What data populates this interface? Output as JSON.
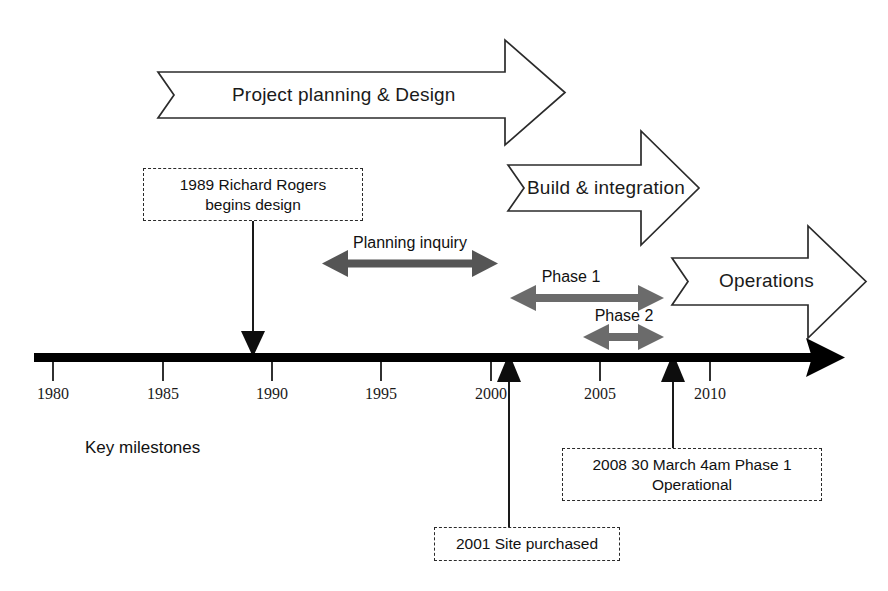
{
  "diagram": {
    "type": "timeline",
    "key_label": "Key milestones",
    "axis": {
      "start_year": 1979,
      "end_year": 2012,
      "tick_labels": [
        "1980",
        "1985",
        "1990",
        "1995",
        "2000",
        "2005",
        "2010"
      ],
      "tick_years": [
        1980,
        1985,
        1990,
        1995,
        2000,
        2005,
        2010
      ],
      "color": "#000000",
      "arrow_direction": "right"
    },
    "phase_arrows": [
      {
        "id": "project-planning-design",
        "label": "Project planning & Design",
        "start_year": 1984.6,
        "end_year": 2003.1,
        "style": "outline-chevron"
      },
      {
        "id": "build-integration",
        "label": "Build & integration",
        "start_year": 1999.6,
        "end_year": 2008.3,
        "style": "outline-chevron"
      },
      {
        "id": "operations",
        "label": "Operations",
        "start_year": 2007.0,
        "end_year": 2015.6,
        "style": "outline-chevron"
      }
    ],
    "span_arrows": [
      {
        "id": "planning-inquiry",
        "label": "Planning inquiry",
        "start_year": 1993.2,
        "end_year": 2001.0,
        "color": "#555555",
        "style": "double-headed"
      },
      {
        "id": "phase-1",
        "label": "Phase 1",
        "start_year": 2001.8,
        "end_year": 2008.7,
        "color": "#6b6b6b",
        "style": "double-headed"
      },
      {
        "id": "phase-2",
        "label": "Phase 2",
        "start_year": 2005.1,
        "end_year": 2008.7,
        "color": "#6b6b6b",
        "style": "double-headed"
      }
    ],
    "milestones": [
      {
        "id": "richard-rogers-design",
        "text": "1989 Richard Rogers begins design",
        "line1": "1989 Richard Rogers",
        "line2": "begins design",
        "year": 1988.6,
        "position": "above",
        "connector": "arrow-down"
      },
      {
        "id": "site-purchased",
        "text": "2001 Site purchased",
        "line1": "2001 Site purchased",
        "line2": "",
        "year": 2000.8,
        "position": "below",
        "connector": "arrow-up"
      },
      {
        "id": "phase-1-operational",
        "text": "2008 30 March 4am Phase 1 Operational",
        "line1": "2008 30 March 4am Phase 1",
        "line2": "Operational",
        "year": 2008.3,
        "position": "below",
        "connector": "arrow-up"
      }
    ]
  }
}
